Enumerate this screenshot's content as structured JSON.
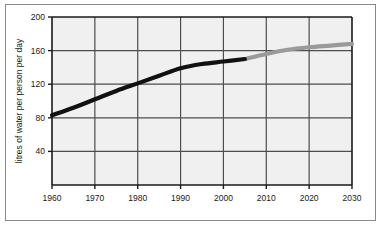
{
  "chart_data": {
    "type": "line",
    "title": "",
    "xlabel": "",
    "ylabel": "litres of water per person per day",
    "xlim": [
      1960,
      2030
    ],
    "ylim": [
      0,
      200
    ],
    "x_ticks": [
      1960,
      1970,
      1980,
      1990,
      2000,
      2010,
      2020,
      2030
    ],
    "y_ticks": [
      40,
      80,
      120,
      160,
      200
    ],
    "grid": true,
    "legend": "none",
    "series": [
      {
        "name": "actual",
        "style": "solid-black",
        "color": "#111111",
        "x": [
          1960,
          1965,
          1970,
          1975,
          1980,
          1985,
          1990,
          1995,
          2000,
          2005
        ],
        "values": [
          83,
          92,
          102,
          112,
          121,
          130,
          139,
          144,
          147,
          150
        ]
      },
      {
        "name": "projected",
        "style": "solid-grey",
        "color": "#9a9a9a",
        "x": [
          2005,
          2010,
          2015,
          2020,
          2025,
          2030
        ],
        "values": [
          150,
          156,
          161,
          164,
          166,
          168
        ]
      }
    ]
  },
  "axes": {
    "y_tick_labels": [
      "200",
      "160",
      "120",
      "80",
      "40"
    ],
    "x_tick_labels": [
      "1960",
      "1970",
      "1980",
      "1990",
      "2000",
      "2010",
      "2020",
      "2030"
    ],
    "y_axis_title": "litres of water per person per day"
  },
  "colors": {
    "plot_background": "#f0f0f0",
    "gridline": "#4d4d4d",
    "axis": "#1a1a1a",
    "actual_line": "#111111",
    "projected_line": "#9a9a9a",
    "frame": "#8a8a8a",
    "page_background": "#ffffff"
  }
}
